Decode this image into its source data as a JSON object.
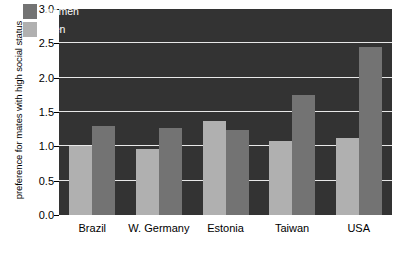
{
  "chart_data": {
    "type": "bar",
    "title": "",
    "xlabel": "",
    "ylabel": "preference for  mates with high social status",
    "categories": [
      "Brazil",
      "W. Germany",
      "Estonia",
      "Taiwan",
      "USA"
    ],
    "series": [
      {
        "name": "men",
        "color": "#b0b0b0",
        "values": [
          1.0,
          0.96,
          1.37,
          1.08,
          1.12
        ]
      },
      {
        "name": "women",
        "color": "#737373",
        "values": [
          1.3,
          1.27,
          1.24,
          1.75,
          2.45
        ]
      }
    ],
    "series_draw_order": [
      "men",
      "women"
    ],
    "legend_order": [
      "women",
      "men"
    ],
    "legend_position": "top-left-inside",
    "ylim": [
      0.0,
      3.0
    ],
    "yticks": [
      0.0,
      0.5,
      1.0,
      1.5,
      2.0,
      2.5,
      3.0
    ],
    "ytick_labels": [
      "0.0",
      "0.5",
      "1.0",
      "1.5",
      "2.0",
      "2.5",
      "3.0"
    ],
    "grid": true,
    "gridline_color": "#e8e8e8",
    "plot_background": "#333333",
    "figure_background": "#ffffff"
  }
}
